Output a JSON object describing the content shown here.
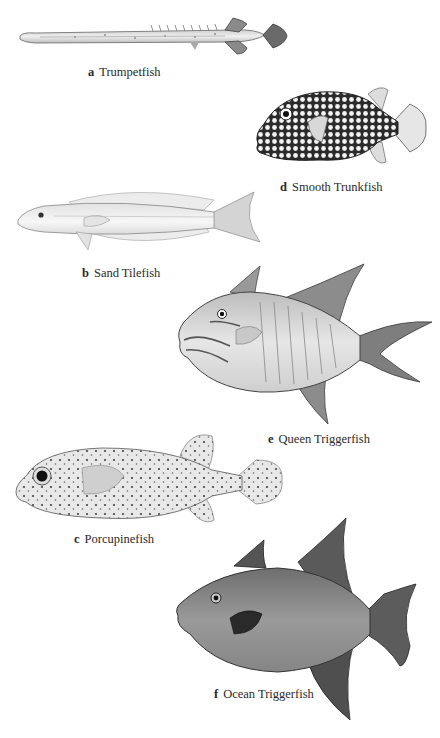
{
  "plate": {
    "background": "#ffffff",
    "fish": [
      {
        "letter": "a",
        "name": "Trumpetfish"
      },
      {
        "letter": "b",
        "name": "Sand Tilefish"
      },
      {
        "letter": "c",
        "name": "Porcupinefish"
      },
      {
        "letter": "d",
        "name": "Smooth Trunkfish"
      },
      {
        "letter": "e",
        "name": "Queen Triggerfish"
      },
      {
        "letter": "f",
        "name": "Ocean Triggerfish"
      }
    ]
  }
}
